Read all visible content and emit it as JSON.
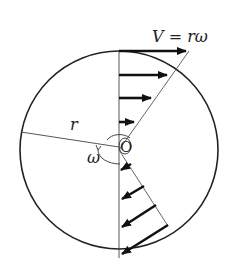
{
  "diagram": {
    "type": "rotating-disk-velocity-profile",
    "labels": {
      "velocity_eq": "V = rω",
      "radius": "r",
      "angular_velocity": "ω",
      "center": "O"
    },
    "colors": {
      "stroke": "#222222",
      "thin": "#555555",
      "background": "#ffffff"
    },
    "upper_arrows_count": 4,
    "lower_arrows_count": 4
  }
}
